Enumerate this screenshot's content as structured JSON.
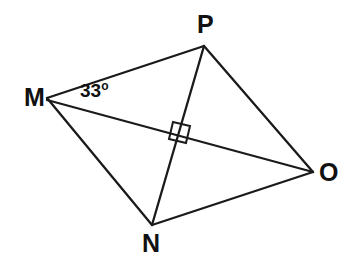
{
  "diagram": {
    "type": "geometry-figure",
    "shape_name": "quadrilateral MPON with diagonals",
    "background_color": "#ffffff",
    "stroke_color": "#1a1a1a",
    "text_color": "#111111",
    "canvas": {
      "width": 346,
      "height": 272
    },
    "vertices": [
      {
        "id": "M",
        "label": "M",
        "x": 47,
        "y": 98,
        "label_x": 24,
        "label_y": 85
      },
      {
        "id": "P",
        "label": "P",
        "x": 204,
        "y": 46,
        "label_x": 197,
        "label_y": 12
      },
      {
        "id": "O",
        "label": "O",
        "x": 313,
        "y": 172,
        "label_x": 319,
        "label_y": 160
      },
      {
        "id": "N",
        "label": "N",
        "x": 152,
        "y": 225,
        "label_x": 142,
        "label_y": 231
      }
    ],
    "edges": [
      {
        "id": "MP",
        "from": "M",
        "to": "P",
        "x1": 47,
        "y1": 98,
        "x2": 204,
        "y2": 46
      },
      {
        "id": "PO",
        "from": "P",
        "to": "O",
        "x1": 204,
        "y1": 46,
        "x2": 313,
        "y2": 172
      },
      {
        "id": "ON",
        "from": "O",
        "to": "N",
        "x1": 313,
        "y1": 172,
        "x2": 152,
        "y2": 225
      },
      {
        "id": "NM",
        "from": "N",
        "to": "M",
        "x1": 152,
        "y1": 225,
        "x2": 47,
        "y2": 98
      }
    ],
    "diagonals": [
      {
        "id": "MO",
        "from": "M",
        "to": "O",
        "x1": 47,
        "y1": 100,
        "x2": 313,
        "y2": 172
      },
      {
        "id": "PN",
        "from": "P",
        "to": "N",
        "x1": 204,
        "y1": 46,
        "x2": 152,
        "y2": 225
      }
    ],
    "intersection": {
      "id": "X",
      "x": 178,
      "y": 137
    },
    "right_angle_marker": {
      "id": "right-angle-at-intersection",
      "at_x": 178,
      "at_y": 137,
      "size": 17,
      "points": "173,122 190,126 186,143 169,139"
    },
    "angle_labels": [
      {
        "id": "angle-PMO",
        "at_vertex": "M",
        "value": "33",
        "unit": "o",
        "text": "33o",
        "label_x": 80,
        "label_y": 80
      }
    ]
  }
}
